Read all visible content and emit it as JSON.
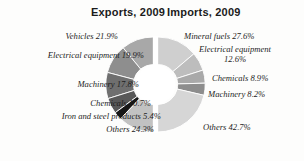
{
  "titles": {
    "exports": "Exports, 2009",
    "imports": "Imports, 2009"
  },
  "labels": {
    "exports": [
      "Vehicles 21.9%",
      "Electrical equipment 19.9%",
      "Machinery 17.8%",
      "Chemicals 10.7%",
      "Iron and steel products 5.4%",
      "Others 24.3%"
    ],
    "imports": [
      "Mineral fuels 27.6%",
      "Electrical equipment 12.6%",
      "Chemicals 8.9%",
      "Machinery 8.2%",
      "Others 42.7%"
    ]
  },
  "colors": {
    "background": "#fdfdfc",
    "text": "#1d1d1d",
    "title": "#1b1b1b",
    "gap": "#ffffff",
    "exports_slices": [
      "#a8a8a8",
      "#8e8e8e",
      "#6f6f6f",
      "#585858",
      "#161616",
      "#c2c2c2"
    ],
    "imports_slices": [
      "#cfcfcf",
      "#bdbdbd",
      "#a9a9a9",
      "#8d8d8d",
      "#d6d6d6"
    ]
  },
  "chart_data": {
    "type": "pie",
    "legend_position": "outside-labels",
    "grid": false,
    "charts": [
      {
        "name": "Exports, 2009",
        "type": "pie",
        "hole": 0.42,
        "half": "left",
        "categories": [
          "Vehicles",
          "Electrical equipment",
          "Machinery",
          "Chemicals",
          "Iron and steel products",
          "Others"
        ],
        "values": [
          21.9,
          19.9,
          17.8,
          10.7,
          5.4,
          24.3
        ],
        "unit": "%"
      },
      {
        "name": "Imports, 2009",
        "type": "pie",
        "hole": 0.42,
        "half": "right",
        "categories": [
          "Mineral fuels",
          "Electrical equipment",
          "Chemicals",
          "Machinery",
          "Others"
        ],
        "values": [
          27.6,
          12.6,
          8.9,
          8.2,
          42.7
        ],
        "unit": "%"
      }
    ]
  }
}
